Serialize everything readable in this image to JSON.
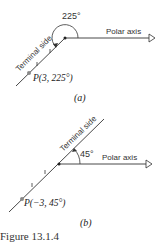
{
  "figure_a": {
    "angle_label": "225°",
    "axis_label": "Polar axis",
    "terminal_label": "Terminal side",
    "point_label": "P(3, 225°)",
    "sublabel": "(a)"
  },
  "figure_b": {
    "angle_label": "45°",
    "axis_label": "Polar axis",
    "terminal_label": "Terminal side",
    "point_label": "P(−3, 45°)",
    "sublabel": "(b)"
  },
  "caption": "Figure 13.1.4",
  "colors": {
    "line": "#333333",
    "point": "#888888"
  }
}
